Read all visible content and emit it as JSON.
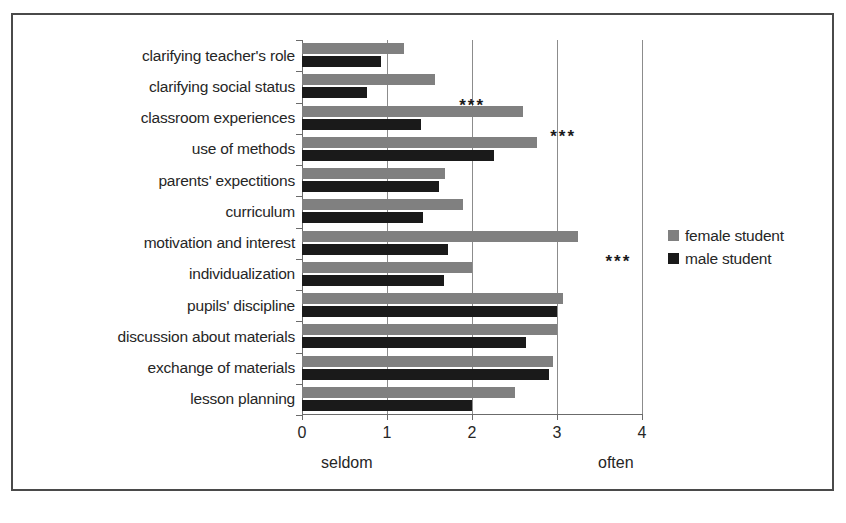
{
  "chart_data": {
    "type": "bar",
    "orientation": "horizontal",
    "title": "",
    "xlabel": "",
    "ylabel": "",
    "xlim": [
      0,
      4
    ],
    "xticks": [
      0,
      1,
      2,
      3,
      4
    ],
    "xtick_labels": [
      "0",
      "1",
      "2",
      "3",
      "4"
    ],
    "grid": true,
    "grid_axis": "x",
    "legend_position": "right",
    "axis_anchor_low": "seldom",
    "axis_anchor_high": "often",
    "categories": [
      "clarifying teacher's role",
      "clarifying social status",
      "classroom experiences",
      "use of methods",
      "parents' expectitions",
      "curriculum",
      "motivation and interest",
      "individualization",
      "pupils' discipline",
      "discussion about materials",
      "exchange of materials",
      "lesson planning"
    ],
    "series": [
      {
        "name": "female student",
        "color": "#808080",
        "values": [
          1.2,
          1.57,
          2.6,
          2.76,
          1.68,
          1.89,
          3.25,
          2.0,
          3.07,
          3.0,
          2.95,
          2.5
        ]
      },
      {
        "name": "male student",
        "color": "#1a1a1a",
        "values": [
          0.93,
          0.77,
          1.4,
          2.26,
          1.61,
          1.42,
          1.72,
          1.67,
          3.0,
          2.64,
          2.9,
          2.0
        ]
      }
    ],
    "annotations": [
      {
        "text": "***",
        "category": "clarifying social status",
        "x": 1.85
      },
      {
        "text": "***",
        "category": "classroom experiences",
        "x": 2.92
      },
      {
        "text": "***",
        "category": "motivation and interest",
        "x": 3.57
      }
    ]
  },
  "legend": {
    "items": [
      {
        "label": "female student",
        "swatch": "female"
      },
      {
        "label": "male student",
        "swatch": "male"
      }
    ]
  }
}
